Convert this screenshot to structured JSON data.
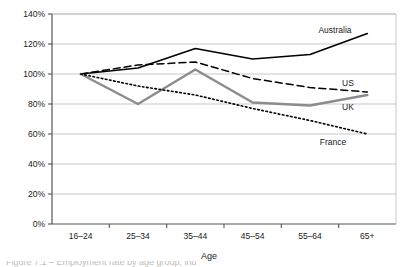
{
  "chart_data": {
    "type": "line",
    "title": "",
    "xlabel": "Age",
    "ylabel": "",
    "categories": [
      "16–24",
      "25–34",
      "35–44",
      "45–54",
      "55–64",
      "65+"
    ],
    "ylim": [
      0,
      140
    ],
    "ytick_labels": [
      "0%",
      "20%",
      "40%",
      "60%",
      "80%",
      "100%",
      "120%",
      "140%"
    ],
    "ytick_values": [
      0,
      20,
      40,
      60,
      80,
      100,
      120,
      140
    ],
    "grid": "horizontal",
    "legend_position": "inline-right-of-lines",
    "series": [
      {
        "name": "Australia",
        "style": "solid",
        "color": "#000000",
        "width": 1.6,
        "values": [
          100,
          104,
          117,
          110,
          113,
          127
        ],
        "label_x": 335,
        "label_y": 33
      },
      {
        "name": "US",
        "style": "dashed",
        "color": "#000000",
        "width": 1.5,
        "values": [
          100,
          106,
          108,
          97,
          91,
          88
        ],
        "label_x": 348,
        "label_y": 86
      },
      {
        "name": "UK",
        "style": "solid",
        "color": "#8c8c8c",
        "width": 2.4,
        "values": [
          100,
          80,
          103,
          81,
          79,
          86
        ],
        "label_x": 348,
        "label_y": 110
      },
      {
        "name": "France",
        "style": "dotted",
        "color": "#000000",
        "width": 1.6,
        "values": [
          100,
          92,
          86,
          77,
          69,
          60
        ],
        "label_x": 333,
        "label_y": 145
      }
    ]
  },
  "axis": {
    "x_title": "Age"
  },
  "caption": {
    "text": "Figure 7.1 – Employment rate by age group, index 16–24 = 100%"
  }
}
